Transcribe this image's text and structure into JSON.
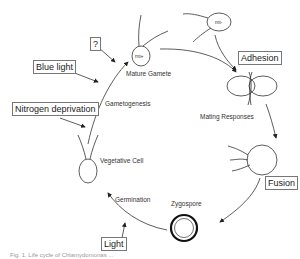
{
  "diagram": {
    "type": "life-cycle",
    "stages": {
      "mature_gamete": "Mature Gamete",
      "gametogenesis": "Gametogenesis",
      "vegetative_cell": "Vegetative Cell",
      "germination": "Germination",
      "zygospore": "Zygospore",
      "mating_responses": "Mating Responses"
    },
    "mating_types": {
      "plus": "mt+",
      "minus": "mt-"
    },
    "triggers": {
      "question": "?",
      "blue_light": "Blue light",
      "nitrogen_deprivation": "Nitrogen deprivation",
      "adhesion": "Adhesion",
      "fusion": "Fusion",
      "light": "Light"
    },
    "caption": "Fig. 1. Life cycle of Chlamydomonas ..."
  }
}
